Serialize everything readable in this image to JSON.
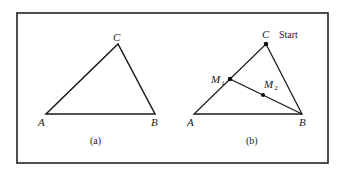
{
  "figure": {
    "frame": {
      "x": 17,
      "y": 13,
      "w": 311,
      "h": 150,
      "stroke": "#222222",
      "stroke_width": 1.6
    },
    "line_color": "#1a1a1a",
    "panels": [
      {
        "id": "a",
        "caption": "(a)",
        "vertices": {
          "A": {
            "label": "A",
            "x": 46,
            "y": 114
          },
          "B": {
            "label": "B",
            "x": 155,
            "y": 114
          },
          "C": {
            "label": "C",
            "x": 118,
            "y": 44
          }
        }
      },
      {
        "id": "b",
        "caption": "(b)",
        "vertices": {
          "A": {
            "label": "A",
            "x": 194,
            "y": 114
          },
          "B": {
            "label": "B",
            "x": 302,
            "y": 114
          },
          "C": {
            "label": "C",
            "x": 266,
            "y": 44
          }
        },
        "points": {
          "M1": {
            "label": "M",
            "sub": "1",
            "x": 230,
            "y": 79
          },
          "M2": {
            "label": "M",
            "sub": "2",
            "x": 263,
            "y": 95
          }
        },
        "start_label": "Start"
      }
    ]
  }
}
